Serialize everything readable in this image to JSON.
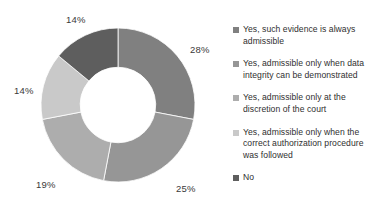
{
  "chart_data": {
    "type": "pie",
    "variant": "doughnut",
    "title": "",
    "xlabel": "",
    "ylabel": "",
    "grid": false,
    "legend_position": "right",
    "start_angle_deg": 0,
    "direction": "clockwise",
    "inner_radius_ratio": 0.49,
    "categories": [
      "Yes, such evidence is always admissible",
      "Yes, admissible only when data integrity can be demonstrated",
      "Yes, admissible only at the discretion of the court",
      "Yes, admissible only when the correct authorization procedure was followed",
      "No"
    ],
    "values": [
      28,
      25,
      19,
      14,
      14
    ],
    "data_labels": [
      "28%",
      "25%",
      "19%",
      "14%",
      "14%"
    ],
    "colors": [
      "#808080",
      "#969696",
      "#adadad",
      "#c9c9c9",
      "#5e5e5e"
    ]
  },
  "slice_labels": [
    {
      "text": "28%",
      "left": 190,
      "top": 44
    },
    {
      "text": "25%",
      "left": 176,
      "top": 183
    },
    {
      "text": "19%",
      "left": 36,
      "top": 179
    },
    {
      "text": "14%",
      "left": 14,
      "top": 85
    },
    {
      "text": "14%",
      "left": 66,
      "top": 14
    }
  ],
  "legend": {
    "items": [
      {
        "label": "Yes, such evidence is always admissible",
        "color": "#808080"
      },
      {
        "label": "Yes, admissible only when data integrity can be demonstrated",
        "color": "#969696"
      },
      {
        "label": "Yes, admissible only at the discretion of the court",
        "color": "#adadad"
      },
      {
        "label": "Yes, admissible only when the correct authorization procedure was followed",
        "color": "#c9c9c9"
      },
      {
        "label": "No",
        "color": "#5e5e5e"
      }
    ]
  }
}
